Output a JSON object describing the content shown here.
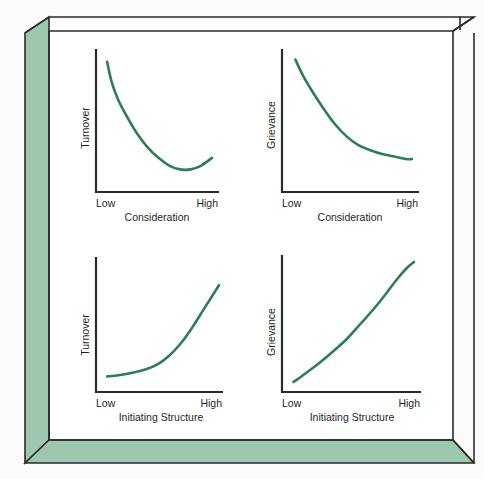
{
  "figure": {
    "background_color": "#fbfbfb",
    "frame": {
      "panel_color": "#9dc8ae",
      "panel_shade_color": "#8bbb9e",
      "edge_color": "#2b2b2b",
      "inner_background": "#ffffff"
    },
    "curve_color": "#2f7d56",
    "axis_color": "#2b2b2b"
  },
  "chart_data": [
    {
      "type": "line",
      "id": "turnover-vs-consideration",
      "position": "top-left",
      "title": "",
      "xlabel": "Consideration",
      "ylabel": "Turnover",
      "xticklabels": [
        "Low",
        "High"
      ],
      "yticklabels": [],
      "grid": false,
      "legend": false,
      "xlim": [
        0,
        1
      ],
      "ylim": [
        0,
        1
      ],
      "shape": "decreasing-then-slightly-increasing (J-curve)",
      "x": [
        0.02,
        0.06,
        0.12,
        0.2,
        0.3,
        0.4,
        0.5,
        0.6,
        0.7,
        0.8,
        0.9,
        1.0
      ],
      "y": [
        0.97,
        0.82,
        0.68,
        0.55,
        0.41,
        0.3,
        0.22,
        0.16,
        0.13,
        0.13,
        0.16,
        0.22
      ]
    },
    {
      "type": "line",
      "id": "grievance-vs-consideration",
      "position": "top-right",
      "title": "",
      "xlabel": "Consideration",
      "ylabel": "Grievance",
      "xticklabels": [
        "Low",
        "High"
      ],
      "yticklabels": [],
      "grid": false,
      "legend": false,
      "xlim": [
        0,
        1
      ],
      "ylim": [
        0,
        1
      ],
      "shape": "monotonically decreasing, convex (exponential decay)",
      "x": [
        0.02,
        0.08,
        0.16,
        0.25,
        0.35,
        0.45,
        0.55,
        0.65,
        0.75,
        0.85,
        0.95,
        1.0
      ],
      "y": [
        0.98,
        0.86,
        0.73,
        0.6,
        0.47,
        0.37,
        0.3,
        0.26,
        0.23,
        0.21,
        0.19,
        0.19
      ]
    },
    {
      "type": "line",
      "id": "turnover-vs-initiating-structure",
      "position": "bottom-left",
      "title": "",
      "xlabel": "Initiating Structure",
      "ylabel": "Turnover",
      "xticklabels": [
        "Low",
        "High"
      ],
      "yticklabels": [],
      "grid": false,
      "legend": false,
      "xlim": [
        0,
        1
      ],
      "ylim": [
        0,
        1
      ],
      "shape": "flat then steeply increasing (exponential growth)",
      "x": [
        0.02,
        0.12,
        0.24,
        0.36,
        0.46,
        0.56,
        0.66,
        0.76,
        0.86,
        0.94,
        1.0
      ],
      "y": [
        0.08,
        0.09,
        0.11,
        0.14,
        0.18,
        0.25,
        0.35,
        0.48,
        0.63,
        0.75,
        0.84
      ]
    },
    {
      "type": "line",
      "id": "grievance-vs-initiating-structure",
      "position": "bottom-right",
      "title": "",
      "xlabel": "Initiating Structure",
      "ylabel": "Grievance",
      "xticklabels": [
        "Low",
        "High"
      ],
      "yticklabels": [],
      "grid": false,
      "legend": false,
      "xlim": [
        0,
        1
      ],
      "ylim": [
        0,
        1
      ],
      "shape": "smoothly increasing, convex",
      "x": [
        0.02,
        0.12,
        0.24,
        0.36,
        0.46,
        0.56,
        0.66,
        0.76,
        0.86,
        0.94,
        1.0
      ],
      "y": [
        0.04,
        0.11,
        0.2,
        0.3,
        0.39,
        0.5,
        0.61,
        0.73,
        0.86,
        0.95,
        1.0
      ]
    }
  ]
}
